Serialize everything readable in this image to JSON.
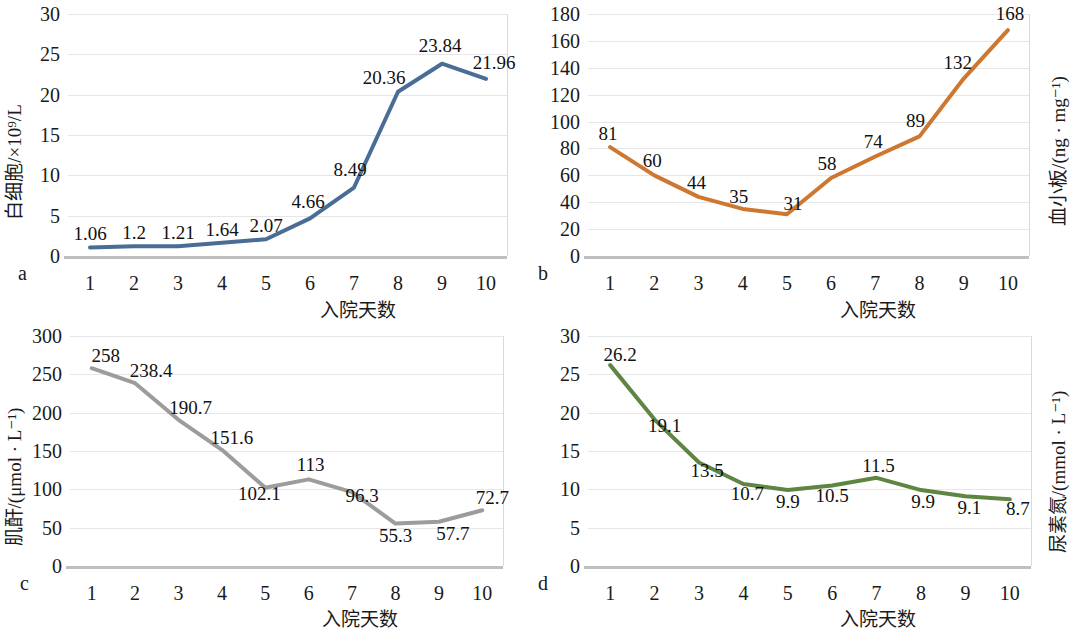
{
  "figure": {
    "xlabel": "入院天数",
    "panels": [
      "a",
      "b",
      "c",
      "d"
    ]
  },
  "chart_data": [
    {
      "panel": "a",
      "type": "line",
      "title": "",
      "ylabel": "白细胞/×10⁹/L",
      "xlabel": "入院天数",
      "categories": [
        1,
        2,
        3,
        4,
        5,
        6,
        7,
        8,
        9,
        10
      ],
      "values": [
        1.06,
        1.2,
        1.21,
        1.64,
        2.07,
        4.66,
        8.49,
        20.36,
        23.84,
        21.96
      ],
      "labels": [
        "1.06",
        "1.2",
        "1.21",
        "1.64",
        "2.07",
        "4.66",
        "8.49",
        "20.36",
        "23.84",
        "21.96"
      ],
      "yticks": [
        0,
        5,
        10,
        15,
        20,
        25,
        30
      ],
      "ylim": [
        0,
        30
      ],
      "xtick_labels": [
        "1",
        "2",
        "3",
        "4",
        "5",
        "6",
        "7",
        "8",
        "9",
        "10"
      ],
      "color": "#4A6D96",
      "grid": true,
      "legend": "none"
    },
    {
      "panel": "b",
      "type": "line",
      "title": "",
      "ylabel": "血小板/(ng · mg⁻¹)",
      "xlabel": "入院天数",
      "categories": [
        1,
        2,
        3,
        4,
        5,
        6,
        7,
        8,
        9,
        10
      ],
      "values": [
        81,
        60,
        44,
        35,
        31,
        58,
        74,
        89,
        132,
        168
      ],
      "labels": [
        "81",
        "60",
        "44",
        "35",
        "31",
        "58",
        "74",
        "89",
        "132",
        "168"
      ],
      "yticks": [
        0,
        20,
        40,
        60,
        80,
        100,
        120,
        140,
        160,
        180
      ],
      "ylim": [
        0,
        180
      ],
      "xtick_labels": [
        "1",
        "2",
        "3",
        "4",
        "5",
        "6",
        "7",
        "8",
        "9",
        "10"
      ],
      "color": "#CE7731",
      "grid": true,
      "legend": "none"
    },
    {
      "panel": "c",
      "type": "line",
      "title": "",
      "ylabel": "肌酐/(μmol · L⁻¹)",
      "xlabel": "入院天数",
      "categories": [
        1,
        2,
        3,
        4,
        5,
        6,
        7,
        8,
        9,
        10
      ],
      "values": [
        258,
        238.4,
        190.7,
        151.6,
        102.1,
        113,
        96.3,
        55.3,
        57.7,
        72.7
      ],
      "labels": [
        "258",
        "238.4",
        "190.7",
        "151.6",
        "102.1",
        "113",
        "96.3",
        "55.3",
        "57.7",
        "72.7"
      ],
      "yticks": [
        0,
        50,
        100,
        150,
        200,
        250,
        300
      ],
      "ylim": [
        0,
        300
      ],
      "xtick_labels": [
        "1",
        "2",
        "3",
        "4",
        "5",
        "6",
        "7",
        "8",
        "9",
        "10"
      ],
      "color": "#9C9C9C",
      "grid": true,
      "legend": "none"
    },
    {
      "panel": "d",
      "type": "line",
      "title": "",
      "ylabel": "尿素氮/(mmol · L⁻¹)",
      "xlabel": "入院天数",
      "categories": [
        1,
        2,
        3,
        4,
        5,
        6,
        7,
        8,
        9,
        10
      ],
      "values": [
        26.2,
        19.1,
        13.5,
        10.7,
        9.9,
        10.5,
        11.5,
        9.9,
        9.1,
        8.7
      ],
      "labels": [
        "26.2",
        "19.1",
        "13.5",
        "10.7",
        "9.9",
        "10.5",
        "11.5",
        "9.9",
        "9.1",
        "8.7"
      ],
      "yticks": [
        0,
        5,
        10,
        15,
        20,
        25,
        30
      ],
      "ylim": [
        0,
        30
      ],
      "xtick_labels": [
        "1",
        "2",
        "3",
        "4",
        "5",
        "6",
        "7",
        "8",
        "9",
        "10"
      ],
      "color": "#5E8541",
      "grid": true,
      "legend": "none"
    }
  ]
}
